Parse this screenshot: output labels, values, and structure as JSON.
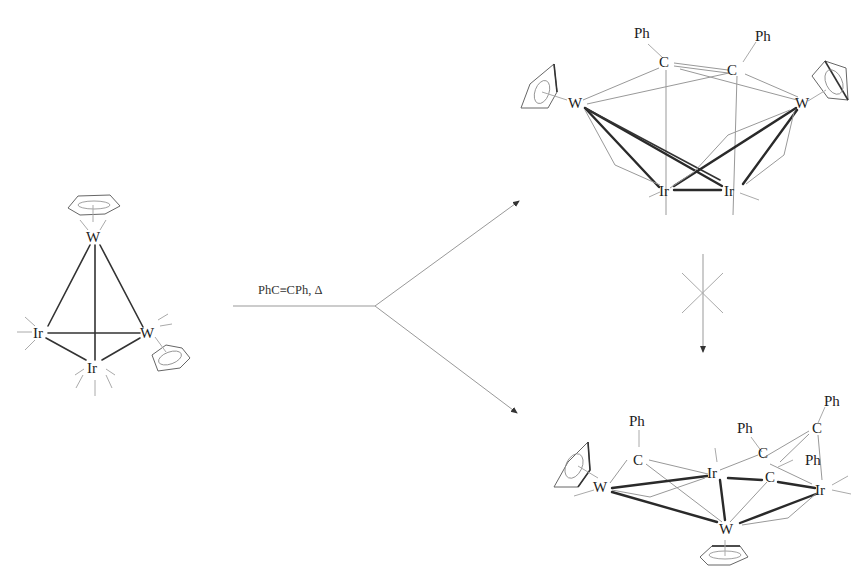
{
  "reactant": {
    "atoms": {
      "w_top": "W",
      "ir_left": "Ir",
      "w_right": "W",
      "ir_bottom": "Ir"
    }
  },
  "reaction": {
    "conditions": "PhC≡CPh, Δ"
  },
  "product_top": {
    "atoms": {
      "ph_left": "Ph",
      "ph_right": "Ph",
      "c_left": "C",
      "c_right": "C",
      "w_left": "W",
      "w_right": "W",
      "ir_left": "Ir",
      "ir_right": "Ir"
    }
  },
  "conversion_arrow": {
    "blocked": true,
    "symbol": "crossed-arrow"
  },
  "product_bottom": {
    "atoms": {
      "ph_1": "Ph",
      "c_1": "C",
      "w_left": "W",
      "ir_mid": "Ir",
      "ph_2": "Ph",
      "c_2": "C",
      "ph_3": "Ph",
      "c_3": "C",
      "c_4": "C",
      "ph_4": "Ph",
      "ir_right": "Ir",
      "w_bottom": "W"
    }
  },
  "colors": {
    "bond": "#333333",
    "ligand": "#aaaaaa",
    "arrow": "#999999"
  }
}
